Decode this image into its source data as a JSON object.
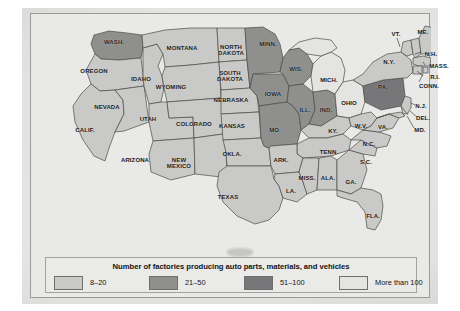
{
  "legend": {
    "title": "Number of factories producing auto parts, materials, and vehicles",
    "items": [
      {
        "label": "8–20",
        "color": "#c9c9c7",
        "key": "tier1"
      },
      {
        "label": "21–50",
        "color": "#8f8f8d",
        "key": "tier2"
      },
      {
        "label": "51–100",
        "color": "#77777a",
        "key": "tier3"
      },
      {
        "label": "More than 100",
        "color": "#e4e4e2",
        "key": "tier4"
      }
    ]
  },
  "map": {
    "title": "United States auto parts factories choropleth",
    "colors": {
      "tier1": "#c9c9c7",
      "tier2": "#8f8f8d",
      "tier3": "#77777a",
      "tier4": "#e4e4e2",
      "water": "#e9e9e7",
      "outline": "#4a4a48"
    },
    "states": [
      {
        "name": "WASH.",
        "tier": "tier2",
        "x": 83,
        "y": 28,
        "size": "s-med"
      },
      {
        "name": "OREGON",
        "tier": "tier1",
        "x": 63,
        "y": 57,
        "size": "s-med"
      },
      {
        "name": "IDAHO",
        "tier": "tier1",
        "x": 110,
        "y": 65,
        "size": "s-med"
      },
      {
        "name": "MONTANA",
        "tier": "tier1",
        "x": 151,
        "y": 34,
        "size": "s-med"
      },
      {
        "name": "WYOMING",
        "tier": "tier1",
        "x": 140,
        "y": 73,
        "size": "s-med"
      },
      {
        "name": "NEVADA",
        "tier": "tier1",
        "x": 76,
        "y": 93,
        "size": "s-med"
      },
      {
        "name": "UTAH",
        "tier": "tier1",
        "x": 117,
        "y": 105,
        "size": "s-med"
      },
      {
        "name": "CALIF.",
        "tier": "tier1",
        "x": 54,
        "y": 116,
        "size": "s-med"
      },
      {
        "name": "ARIZONA",
        "tier": "tier1",
        "x": 104,
        "y": 146,
        "size": "s-med"
      },
      {
        "name": "COLORADO",
        "tier": "tier1",
        "x": 163,
        "y": 110,
        "size": "s-med"
      },
      {
        "name": "NEW\nMEXICO",
        "tier": "tier1",
        "x": 148,
        "y": 149,
        "size": "s-med"
      },
      {
        "name": "NORTH\nDAKOTA",
        "tier": "tier1",
        "x": 200,
        "y": 36,
        "size": "s-med"
      },
      {
        "name": "SOUTH\nDAKOTA",
        "tier": "tier1",
        "x": 199,
        "y": 62,
        "size": "s-med"
      },
      {
        "name": "NEBRASKA",
        "tier": "tier1",
        "x": 200,
        "y": 86,
        "size": "s-med"
      },
      {
        "name": "KANSAS",
        "tier": "tier1",
        "x": 201,
        "y": 112,
        "size": "s-med"
      },
      {
        "name": "OKLA.",
        "tier": "tier1",
        "x": 201,
        "y": 140,
        "size": "s-med"
      },
      {
        "name": "TEXAS",
        "tier": "tier1",
        "x": 197,
        "y": 183,
        "size": "s-med"
      },
      {
        "name": "MINN.",
        "tier": "tier2",
        "x": 237,
        "y": 30,
        "size": "s-med"
      },
      {
        "name": "IOWA",
        "tier": "tier2",
        "x": 242,
        "y": 80,
        "size": "s-med"
      },
      {
        "name": "MO.",
        "tier": "tier2",
        "x": 244,
        "y": 116,
        "size": "s-med"
      },
      {
        "name": "ARK.",
        "tier": "tier1",
        "x": 250,
        "y": 146,
        "size": "s-med"
      },
      {
        "name": "LA.",
        "tier": "tier1",
        "x": 260,
        "y": 177,
        "size": "s-med"
      },
      {
        "name": "WIS.",
        "tier": "tier2",
        "x": 265,
        "y": 55,
        "size": "s-med"
      },
      {
        "name": "ILL.",
        "tier": "tier2",
        "x": 274,
        "y": 96,
        "size": "s-med"
      },
      {
        "name": "MICH.",
        "tier": "tier4",
        "x": 298,
        "y": 66,
        "size": "s-med"
      },
      {
        "name": "IND.",
        "tier": "tier2",
        "x": 295,
        "y": 96,
        "size": "s-med"
      },
      {
        "name": "OHIO",
        "tier": "tier4",
        "x": 318,
        "y": 89,
        "size": "s-med"
      },
      {
        "name": "KY.",
        "tier": "tier1",
        "x": 302,
        "y": 117,
        "size": "s-med"
      },
      {
        "name": "TENN.",
        "tier": "tier1",
        "x": 298,
        "y": 138,
        "size": "s-med"
      },
      {
        "name": "MISS.",
        "tier": "tier1",
        "x": 276,
        "y": 164,
        "size": "s-med"
      },
      {
        "name": "ALA.",
        "tier": "tier1",
        "x": 297,
        "y": 164,
        "size": "s-med"
      },
      {
        "name": "GA.",
        "tier": "tier1",
        "x": 320,
        "y": 168,
        "size": "s-med"
      },
      {
        "name": "FLA.",
        "tier": "tier1",
        "x": 342,
        "y": 202,
        "size": "s-med"
      },
      {
        "name": "S.C.",
        "tier": "tier1",
        "x": 335,
        "y": 148,
        "size": "s-med"
      },
      {
        "name": "N.C.",
        "tier": "tier1",
        "x": 338,
        "y": 130,
        "size": "s-med"
      },
      {
        "name": "W.V.",
        "tier": "tier1",
        "x": 330,
        "y": 112,
        "size": "s-med"
      },
      {
        "name": "VA.",
        "tier": "tier1",
        "x": 352,
        "y": 113,
        "size": "s-med"
      },
      {
        "name": "PA.",
        "tier": "tier3",
        "x": 352,
        "y": 73,
        "size": "s-med"
      },
      {
        "name": "N.Y.",
        "tier": "tier1",
        "x": 358,
        "y": 48,
        "size": "s-med"
      },
      {
        "name": "VT.",
        "tier": "tier1",
        "x": 365,
        "y": 20,
        "size": "s-med"
      },
      {
        "name": "ME.",
        "tier": "tier1",
        "x": 392,
        "y": 18,
        "size": "s-med"
      },
      {
        "name": "N.H.",
        "tier": "tier1",
        "x": 400,
        "y": 40,
        "size": "s-med"
      },
      {
        "name": "MASS.",
        "tier": "tier1",
        "x": 408,
        "y": 52,
        "size": "s-med"
      },
      {
        "name": "R.I.",
        "tier": "tier1",
        "x": 404,
        "y": 63,
        "size": "s-med"
      },
      {
        "name": "CONN.",
        "tier": "tier1",
        "x": 398,
        "y": 72,
        "size": "s-med"
      },
      {
        "name": "N.J.",
        "tier": "tier1",
        "x": 390,
        "y": 92,
        "size": "s-med"
      },
      {
        "name": "DEL.",
        "tier": "tier1",
        "x": 392,
        "y": 104,
        "size": "s-med"
      },
      {
        "name": "MD.",
        "tier": "tier1",
        "x": 389,
        "y": 116,
        "size": "s-med"
      }
    ]
  }
}
